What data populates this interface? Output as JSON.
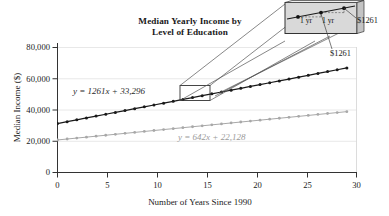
{
  "chart_data": {
    "type": "line",
    "title": "Median Yearly Income by Level of Education",
    "title_line1": "Median Yearly Income by",
    "title_line2": "Level of Education",
    "xlabel": "Number of Years Since 1990",
    "ylabel": "Median Income ($)",
    "xlim": [
      0,
      31
    ],
    "ylim": [
      0,
      85000
    ],
    "xticks": [
      0,
      5,
      10,
      15,
      20,
      25,
      30
    ],
    "xticklabels": [
      "0",
      "5",
      "10",
      "15",
      "20",
      "25",
      "30"
    ],
    "yticks": [
      0,
      20000,
      40000,
      60000,
      80000
    ],
    "yticklabels": [
      "0",
      "20,000",
      "40,000",
      "60,000",
      "80,000"
    ],
    "grid": "horizontal-light",
    "legend": "none",
    "x": [
      0,
      1,
      2,
      3,
      4,
      5,
      6,
      7,
      8,
      9,
      10,
      11,
      12,
      13,
      14,
      15,
      16,
      17,
      18,
      19,
      20,
      21,
      22,
      23,
      24,
      25,
      26,
      27,
      28,
      29,
      30
    ],
    "series": [
      {
        "name": "Bachelor's degree or higher",
        "color": "#1a1a1a",
        "equation": "y = 1261x + 33,296",
        "slope": 1261,
        "intercept": 33296,
        "values": [
          33296,
          34557,
          35818,
          37079,
          38340,
          39601,
          40862,
          42123,
          43384,
          44645,
          45906,
          47167,
          48428,
          49689,
          50950,
          52211,
          53472,
          54733,
          55994,
          57255,
          58516,
          59777,
          61038,
          62299,
          63560,
          64821,
          66082,
          67343,
          68604,
          69865,
          71126
        ]
      },
      {
        "name": "High school diploma",
        "color": "#a8a8a8",
        "equation": "y = 642x + 22,128",
        "slope": 642,
        "intercept": 22128,
        "values": [
          22128,
          22770,
          23412,
          24054,
          24696,
          25338,
          25980,
          26622,
          27264,
          27906,
          28548,
          29190,
          29832,
          30474,
          31116,
          31758,
          32400,
          33042,
          33684,
          34326,
          34968,
          35610,
          36252,
          36894,
          37536,
          38178,
          38820,
          39462,
          40104,
          40746,
          41388
        ]
      }
    ],
    "annotations": {
      "zoom_rect_label": "magnified region",
      "zoom_rect_x_range": [
        15,
        17
      ],
      "callout_rise_label_1": "1 yr",
      "callout_rise_label_2": "1 yr",
      "callout_value_right": "$1261",
      "callout_value_mid": "$1261"
    }
  }
}
